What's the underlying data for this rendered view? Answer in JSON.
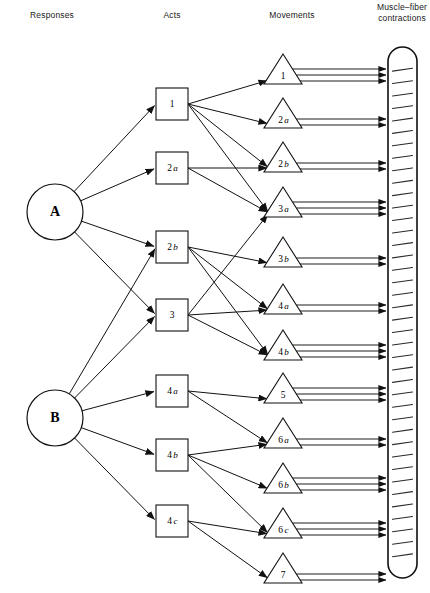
{
  "columns": [
    {
      "id": "responses",
      "label": "Responses",
      "x": 52,
      "y": 18
    },
    {
      "id": "acts",
      "label": "Acts",
      "x": 172,
      "y": 18
    },
    {
      "id": "movements",
      "label": "Movements",
      "x": 292,
      "y": 18
    },
    {
      "id": "muscle",
      "label_line1": "Muscle–fiber",
      "label_line2": "contractions",
      "x": 402,
      "y": 10
    }
  ],
  "responses": [
    {
      "id": "A",
      "label": "A",
      "cx": 55,
      "cy": 212,
      "r": 28
    },
    {
      "id": "B",
      "label": "B",
      "cx": 55,
      "cy": 418,
      "r": 28
    }
  ],
  "acts": [
    {
      "id": "act1",
      "label": "1",
      "sub": "",
      "cx": 172,
      "cy": 104,
      "size": 32
    },
    {
      "id": "act2a",
      "label": "2",
      "sub": "a",
      "cx": 172,
      "cy": 168,
      "size": 32
    },
    {
      "id": "act2b",
      "label": "2",
      "sub": "b",
      "cx": 172,
      "cy": 247,
      "size": 32
    },
    {
      "id": "act3",
      "label": "3",
      "sub": "",
      "cx": 172,
      "cy": 315,
      "size": 32
    },
    {
      "id": "act4a",
      "label": "4",
      "sub": "a",
      "cx": 172,
      "cy": 391,
      "size": 32
    },
    {
      "id": "act4b",
      "label": "4",
      "sub": "b",
      "cx": 172,
      "cy": 455,
      "size": 32
    },
    {
      "id": "act4c",
      "label": "4",
      "sub": "c",
      "cx": 172,
      "cy": 521,
      "size": 32
    }
  ],
  "movements": [
    {
      "id": "mv1",
      "label": "1",
      "sub": "",
      "cx": 283,
      "cy": 69,
      "w": 38,
      "h": 30,
      "fibers": 3
    },
    {
      "id": "mv2a",
      "label": "2",
      "sub": "a",
      "cx": 283,
      "cy": 113,
      "w": 38,
      "h": 30,
      "fibers": 2
    },
    {
      "id": "mv2b",
      "label": "2",
      "sub": "b",
      "cx": 283,
      "cy": 157,
      "w": 38,
      "h": 30,
      "fibers": 2
    },
    {
      "id": "mv3a",
      "label": "3",
      "sub": "a",
      "cx": 283,
      "cy": 202,
      "w": 38,
      "h": 30,
      "fibers": 3
    },
    {
      "id": "mv3b",
      "label": "3",
      "sub": "b",
      "cx": 283,
      "cy": 252,
      "w": 38,
      "h": 30,
      "fibers": 2
    },
    {
      "id": "mv4a",
      "label": "4",
      "sub": "a",
      "cx": 283,
      "cy": 299,
      "w": 38,
      "h": 30,
      "fibers": 2
    },
    {
      "id": "mv4b",
      "label": "4",
      "sub": "b",
      "cx": 283,
      "cy": 345,
      "w": 38,
      "h": 30,
      "fibers": 3
    },
    {
      "id": "mv5",
      "label": "5",
      "sub": "",
      "cx": 283,
      "cy": 388,
      "w": 38,
      "h": 30,
      "fibers": 3
    },
    {
      "id": "mv6a",
      "label": "6",
      "sub": "a",
      "cx": 283,
      "cy": 433,
      "w": 38,
      "h": 30,
      "fibers": 2
    },
    {
      "id": "mv6b",
      "label": "6",
      "sub": "b",
      "cx": 283,
      "cy": 478,
      "w": 38,
      "h": 30,
      "fibers": 3
    },
    {
      "id": "mv6c",
      "label": "6",
      "sub": "c",
      "cx": 283,
      "cy": 523,
      "w": 38,
      "h": 30,
      "fibers": 3
    },
    {
      "id": "mv7",
      "label": "7",
      "sub": "",
      "cx": 283,
      "cy": 568,
      "w": 38,
      "h": 30,
      "fibers": 2
    }
  ],
  "muscle_bar": {
    "x": 388,
    "y": 47,
    "width": 29,
    "height": 531,
    "ticks": 40
  },
  "edges_response_to_act": [
    {
      "from": "A",
      "to": "act1"
    },
    {
      "from": "A",
      "to": "act2a"
    },
    {
      "from": "A",
      "to": "act2b"
    },
    {
      "from": "A",
      "to": "act3"
    },
    {
      "from": "B",
      "to": "act2b"
    },
    {
      "from": "B",
      "to": "act3"
    },
    {
      "from": "B",
      "to": "act4a"
    },
    {
      "from": "B",
      "to": "act4b"
    },
    {
      "from": "B",
      "to": "act4c"
    }
  ],
  "edges_act_to_movement": [
    {
      "from": "act1",
      "to": "mv1"
    },
    {
      "from": "act1",
      "to": "mv2a"
    },
    {
      "from": "act1",
      "to": "mv2b"
    },
    {
      "from": "act1",
      "to": "mv3a"
    },
    {
      "from": "act2a",
      "to": "mv2b"
    },
    {
      "from": "act2a",
      "to": "mv3a"
    },
    {
      "from": "act2b",
      "to": "mv3b"
    },
    {
      "from": "act2b",
      "to": "mv4a"
    },
    {
      "from": "act2b",
      "to": "mv4b"
    },
    {
      "from": "act3",
      "to": "mv3a"
    },
    {
      "from": "act3",
      "to": "mv4a"
    },
    {
      "from": "act3",
      "to": "mv4b"
    },
    {
      "from": "act4a",
      "to": "mv5"
    },
    {
      "from": "act4a",
      "to": "mv6a"
    },
    {
      "from": "act4b",
      "to": "mv6a"
    },
    {
      "from": "act4b",
      "to": "mv6b"
    },
    {
      "from": "act4b",
      "to": "mv6c"
    },
    {
      "from": "act4c",
      "to": "mv6c"
    },
    {
      "from": "act4c",
      "to": "mv7"
    }
  ],
  "colors": {
    "stroke": "#111111",
    "background": "#ffffff",
    "text": "#1a1a1a"
  }
}
